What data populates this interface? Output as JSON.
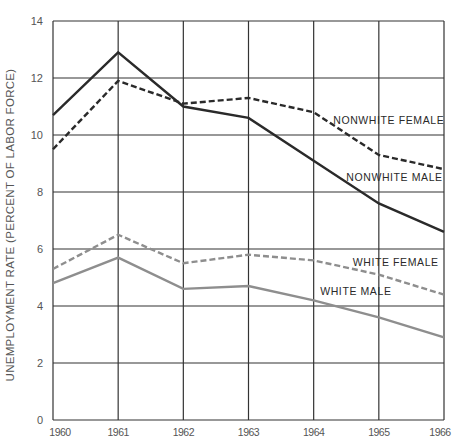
{
  "chart_data": {
    "type": "line",
    "title": "",
    "xlabel": "",
    "ylabel": "UNEMPLOYMENT RATE (PERCENT OF LABOR FORCE)",
    "x": [
      1960,
      1961,
      1962,
      1963,
      1964,
      1965,
      1966
    ],
    "x_tick_labels": [
      "1960",
      "1961",
      "1962",
      "1963",
      "1964",
      "1965",
      "1966"
    ],
    "y_ticks": [
      0,
      2,
      4,
      6,
      8,
      10,
      12,
      14
    ],
    "y_tick_labels": [
      "0",
      "2",
      "4",
      "6",
      "8",
      "10",
      "12",
      "14"
    ],
    "ylim": [
      0,
      14
    ],
    "grid": true,
    "legend": "inline labels",
    "series": [
      {
        "name": "NONWHITE FEMALE",
        "values": [
          9.5,
          11.9,
          11.1,
          11.3,
          10.8,
          9.3,
          8.8
        ],
        "color": "#2a2a2a",
        "style": "dashed",
        "label_x": 1964.3,
        "label_y": 10.4
      },
      {
        "name": "NONWHITE MALE",
        "values": [
          10.7,
          12.9,
          11.0,
          10.6,
          9.1,
          7.6,
          6.6
        ],
        "color": "#2a2a2a",
        "style": "solid",
        "label_x": 1964.5,
        "label_y": 8.4
      },
      {
        "name": "WHITE FEMALE",
        "values": [
          5.3,
          6.5,
          5.5,
          5.8,
          5.6,
          5.1,
          4.4
        ],
        "color": "#8e8e8e",
        "style": "dashed",
        "label_x": 1964.6,
        "label_y": 5.4
      },
      {
        "name": "WHITE MALE",
        "values": [
          4.8,
          5.7,
          4.6,
          4.7,
          4.2,
          3.6,
          2.9
        ],
        "color": "#8e8e8e",
        "style": "solid",
        "label_x": 1964.1,
        "label_y": 4.4
      }
    ]
  }
}
